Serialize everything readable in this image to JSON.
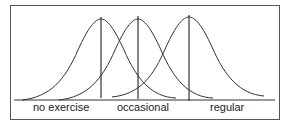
{
  "diagram": {
    "type": "overlapping normal distributions",
    "curves": [
      {
        "label": "no exercise",
        "mean_x": 101
      },
      {
        "label": "occasional",
        "mean_x": 138
      },
      {
        "label": "regular",
        "mean_x": 189
      }
    ],
    "labels": {
      "no_exercise": "no exercise",
      "occasional": "occasional",
      "regular": "regular"
    }
  }
}
